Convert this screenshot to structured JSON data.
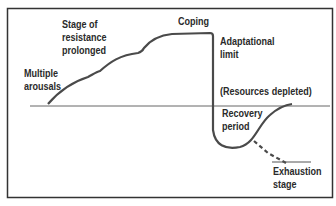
{
  "diagram": {
    "type": "stress-response curve",
    "labels": {
      "multiple_arousals": [
        "Multiple",
        "arousals"
      ],
      "stage_of_resistance": [
        "Stage of",
        "resistance",
        "prolonged"
      ],
      "coping": "Coping",
      "adaptational_limit": [
        "Adaptational",
        "limit"
      ],
      "resources_depleted": "(Resources depleted)",
      "recovery_period": [
        "Recovery",
        "period"
      ],
      "exhaustion_stage": [
        "Exhaustion",
        "stage"
      ]
    },
    "colors": {
      "line": "#4a4a4a",
      "frame": "#333333",
      "baseline": "#555555"
    }
  }
}
